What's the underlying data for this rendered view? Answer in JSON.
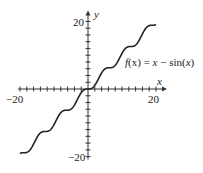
{
  "chart_data": {
    "type": "line",
    "title": "",
    "function_label": "f(x) = x − sin(x)",
    "function_label_parts": {
      "f": "f",
      "x1": "(x)",
      "eq": " = ",
      "x2": "x",
      "minus": " − sin(",
      "x3": "x",
      "close": ")"
    },
    "xlabel": "x",
    "ylabel": "y",
    "xlim": [
      -20,
      20
    ],
    "ylim": [
      -20,
      20
    ],
    "x_tick_labels": [
      "−20",
      "20"
    ],
    "y_tick_labels": [
      "20",
      "−20"
    ],
    "x_tick_step": 2,
    "y_tick_step": 2,
    "grid": false,
    "legend": "none",
    "series": [
      {
        "name": "f(x) = x − sin(x)",
        "x": [
          -20,
          -18,
          -16,
          -14,
          -12,
          -10,
          -8,
          -6,
          -4,
          -2,
          0,
          2,
          4,
          6,
          8,
          10,
          12,
          14,
          16,
          18,
          20
        ],
        "values": [
          -19.09,
          -17.25,
          -16.29,
          -14.99,
          -11.46,
          -9.46,
          -8.99,
          -6.28,
          -3.24,
          -1.09,
          0,
          1.09,
          3.24,
          6.28,
          8.99,
          9.46,
          11.46,
          14.99,
          16.29,
          17.25,
          19.09
        ]
      }
    ]
  }
}
